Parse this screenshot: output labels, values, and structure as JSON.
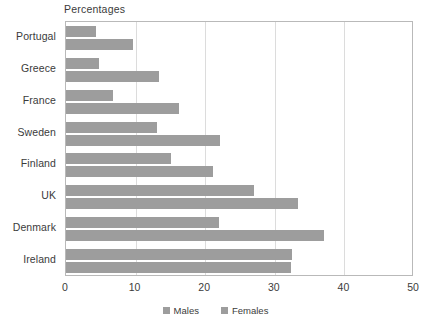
{
  "chart_data": {
    "type": "bar",
    "orientation": "horizontal",
    "title": "",
    "xlabel": "Percentages",
    "ylabel": "",
    "xlim": [
      0,
      50
    ],
    "xticks": [
      0,
      10,
      20,
      30,
      40,
      50
    ],
    "grid": true,
    "gridlines_at": [
      10,
      20,
      30,
      40
    ],
    "legend_position": "bottom-center",
    "categories": [
      "Portugal",
      "Greece",
      "France",
      "Sweden",
      "Finland",
      "UK",
      "Denmark",
      "Ireland"
    ],
    "series": [
      {
        "name": "Males",
        "color": "#9d9d9d",
        "values": [
          4.3,
          4.7,
          6.7,
          13.1,
          15.1,
          27.0,
          22.0,
          32.4
        ]
      },
      {
        "name": "Females",
        "color": "#9d9d9d",
        "values": [
          9.6,
          13.3,
          16.2,
          22.1,
          21.1,
          33.4,
          37.1,
          32.3
        ]
      }
    ]
  },
  "axis": {
    "title": "Percentages",
    "tick_labels": [
      "0",
      "10",
      "20",
      "30",
      "40",
      "50"
    ]
  },
  "legend": {
    "items": [
      {
        "label": "Males",
        "color": "#9d9d9d"
      },
      {
        "label": "Females",
        "color": "#9d9d9d"
      }
    ]
  },
  "colors": {
    "bar": "#9d9d9d",
    "frame": "#b9b9b9",
    "gridline": "#dcdcdc",
    "text": "#3b3b3b",
    "background": "#ffffff"
  }
}
